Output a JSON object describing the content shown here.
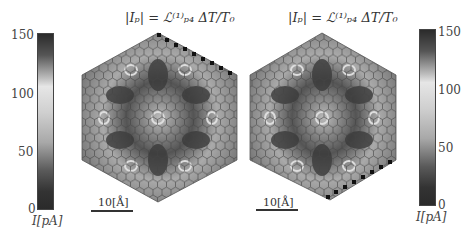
{
  "figure": {
    "panels": [
      {
        "title": "|I_p| = L_{p4}^{(1)} ΔT/T_0",
        "title_html_main": "|I",
        "scale_label": "10[Å]"
      },
      {
        "title": "|I_p| = L_{p4}^{(1)} ΔT/T_0",
        "scale_label": "10[Å]"
      }
    ],
    "colorbar_left": {
      "ticks": [
        "150",
        "100",
        "50",
        "0"
      ],
      "label": "I[pA]"
    },
    "colorbar_right": {
      "ticks": [
        "150",
        "100",
        "50",
        "0"
      ],
      "label": "I[pA]"
    },
    "colors": {
      "high": "#2a2a2a",
      "mid": "#e0e0e0",
      "low": "#3a3a3a",
      "lattice": "#555555"
    }
  },
  "text": {
    "title_left": "|Iₚ| = ℒ⁽¹⁾ₚ₄ ΔT/T₀",
    "title_right": "|Iₚ| = ℒ⁽¹⁾ₚ₄ ΔT/T₀",
    "scale_left": "10[Å]",
    "scale_right": "10[Å]",
    "cb_left_150": "150",
    "cb_left_100": "100",
    "cb_left_50": "50",
    "cb_left_0": "0",
    "cb_left_label": "I[pA]",
    "cb_right_150": "150",
    "cb_right_100": "100",
    "cb_right_50": "50",
    "cb_right_0": "0",
    "cb_right_label": "I[pA]"
  }
}
